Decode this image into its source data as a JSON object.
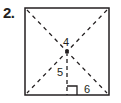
{
  "problem": {
    "number": "2."
  },
  "figure": {
    "shape": "square",
    "stroke_color": "#231f20",
    "labels": {
      "top_segment": "4",
      "apothem": "5",
      "half_side": "6"
    },
    "elements": [
      "diagonal-dashed-1",
      "diagonal-dashed-2",
      "apothem-dashed",
      "center-point",
      "right-angle-mark"
    ]
  }
}
